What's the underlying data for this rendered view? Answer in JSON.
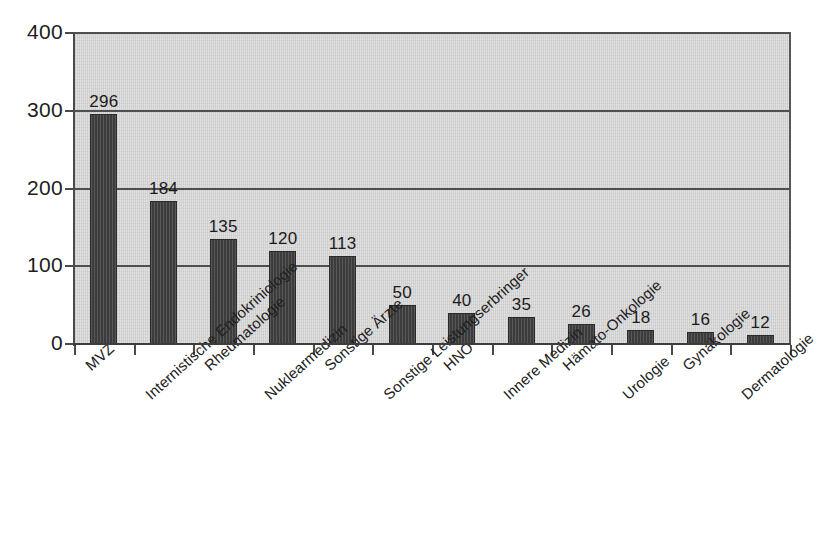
{
  "chart_data": {
    "type": "bar",
    "title": "",
    "subtitle": "",
    "xlabel": "",
    "ylabel": "",
    "ylim": [
      0,
      400
    ],
    "yticks": [
      0,
      100,
      200,
      300,
      400
    ],
    "grid": true,
    "legend": false,
    "legend_position": "none",
    "orientation": "vertical",
    "categories": [
      "MVZ",
      "Internistische Endokriniologie",
      "Rheumatologie",
      "Nuklearmedizin",
      "Sonstige Ärzte",
      "Sonstige Leistungserbringer",
      "HNO",
      "Innere Medizin",
      "Hämato-Onkologie",
      "Urologie",
      "Gynäkologie",
      "Dermatologie"
    ],
    "values": [
      296,
      184,
      135,
      120,
      113,
      50,
      40,
      35,
      26,
      18,
      16,
      12
    ],
    "value_labels": [
      "296",
      "184",
      "135",
      "120",
      "113",
      "50",
      "40",
      "35",
      "26",
      "18",
      "16",
      "12"
    ],
    "ytick_labels": [
      "0",
      "100",
      "200",
      "300",
      "400"
    ],
    "colors": {
      "bar_fill": "#3c3c3c",
      "bar_edge": "#2a2a2a",
      "plot_background": "#d2d2d2",
      "figure_background": "#ffffff",
      "gridline": "#4f4f4f",
      "axis": "#4a4a4a",
      "text": "#1d1d1d"
    },
    "label_rotation_degrees": -42
  }
}
